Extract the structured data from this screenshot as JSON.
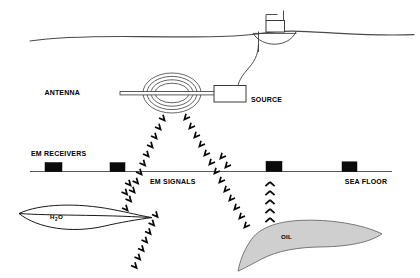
{
  "figure": {
    "width": 420,
    "height": 278,
    "background": "#ffffff"
  },
  "labels": {
    "antenna": "ANTENNA",
    "source": "SOURCE",
    "em_receivers": "EM RECEIVERS",
    "em_signals": "EM SIGNALS",
    "sea_floor": "SEA FLOOR",
    "water_main": "H",
    "water_sub": "2",
    "water_tail": "O",
    "oil": "OIL"
  },
  "colors": {
    "ink": "#0a0a0a",
    "line_gray": "#4a4a4a",
    "coil_gray": "#555555",
    "floor_gray": "#5a5a5a",
    "oil_fill": "#cfcfcf",
    "oil_stroke": "#6a6a6a",
    "background": "#ffffff"
  },
  "geometry": {
    "sea_surface_y": 36,
    "sea_floor_y": 170,
    "antenna_center": {
      "x": 172,
      "y": 93
    },
    "source_box": {
      "x": 214,
      "y": 86,
      "width": 32,
      "height": 16
    },
    "ship": {
      "x": 268,
      "y": 36
    }
  },
  "receivers": [
    {
      "id": "receiver-1",
      "x": 45,
      "y": 163,
      "width": 17,
      "height": 9
    },
    {
      "id": "receiver-2",
      "x": 110,
      "y": 163,
      "width": 15,
      "height": 9
    },
    {
      "id": "receiver-3",
      "x": 266,
      "y": 160,
      "width": 16,
      "height": 10
    },
    {
      "id": "receiver-4",
      "x": 342,
      "y": 161,
      "width": 15,
      "height": 9
    }
  ],
  "signal_paths": [
    {
      "id": "signal-down-left",
      "from": "antenna",
      "to": "water-body",
      "direction": "downward-left"
    },
    {
      "id": "signal-down-right",
      "from": "antenna",
      "to": "oil-body",
      "direction": "downward-right"
    },
    {
      "id": "signal-up-left",
      "from": "water-body",
      "to": "receiver-2",
      "direction": "upward"
    },
    {
      "id": "signal-up-right",
      "from": "oil-body",
      "to": "receiver-3",
      "direction": "upward"
    }
  ],
  "bodies": [
    {
      "id": "water-body",
      "label": "H2O",
      "fill": "none",
      "description": "lens-shaped brine-saturated layer"
    },
    {
      "id": "oil-body",
      "label": "OIL",
      "fill": "#cfcfcf",
      "description": "crescent-shaped hydrocarbon reservoir"
    }
  ]
}
